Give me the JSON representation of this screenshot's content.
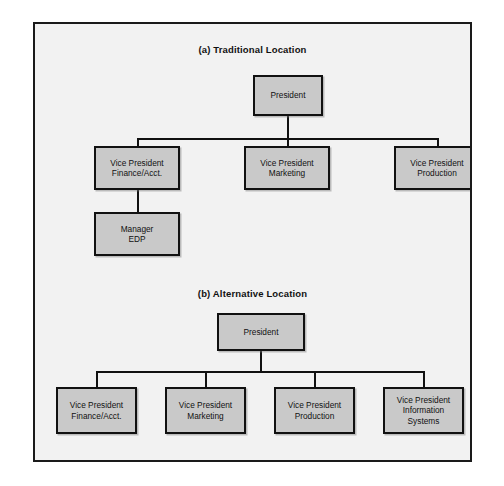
{
  "figure": {
    "panels": [
      {
        "id": "a",
        "heading": "(a) Traditional Location",
        "nodes": [
          {
            "key": "president",
            "label": "President"
          },
          {
            "key": "vp_finance",
            "label": "Vice President\nFinance/Acct."
          },
          {
            "key": "vp_marketing",
            "label": "Vice President\nMarketing"
          },
          {
            "key": "vp_production",
            "label": "Vice President\nProduction"
          },
          {
            "key": "manager_edp",
            "label": "Manager\nEDP"
          }
        ]
      },
      {
        "id": "b",
        "heading": "(b) Alternative Location",
        "nodes": [
          {
            "key": "president",
            "label": "President"
          },
          {
            "key": "vp_finance",
            "label": "Vice President\nFinance/Acct."
          },
          {
            "key": "vp_marketing",
            "label": "Vice President\nMarketing"
          },
          {
            "key": "vp_production",
            "label": "Vice President\nProduction"
          },
          {
            "key": "vp_information_systems",
            "label": "Vice President\nInformation\nSystems"
          }
        ]
      }
    ]
  },
  "colors": {
    "node_fill": "#c9c9c9",
    "node_border": "#111111",
    "frame_border": "#1a1a1a",
    "frame_background": "#f2f2f2",
    "page_background": "#ffffff",
    "text": "#111111"
  }
}
